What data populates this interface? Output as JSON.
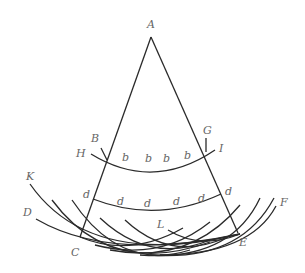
{
  "diagram": {
    "labels": {
      "A": "A",
      "B": "B",
      "G": "G",
      "H": "H",
      "I": "I",
      "K": "K",
      "D": "D",
      "F": "F",
      "L": "L",
      "C": "C",
      "E": "E"
    },
    "upper_arc_marks": [
      "b",
      "b",
      "b",
      "b",
      "b"
    ],
    "lower_arc_marks": [
      "d",
      "d",
      "d",
      "d",
      "d",
      "d"
    ],
    "colors": {
      "line": "#2a2a2a",
      "label": "#666666"
    }
  }
}
